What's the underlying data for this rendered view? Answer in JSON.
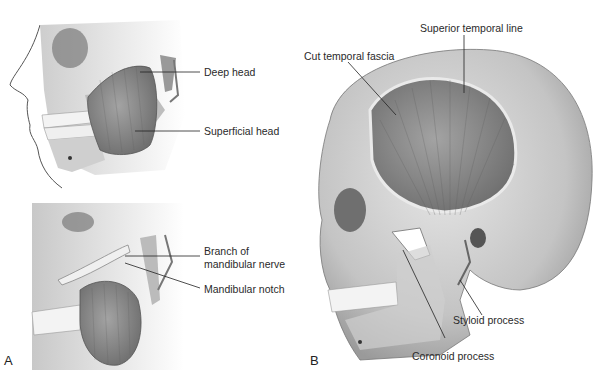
{
  "figure": {
    "panels": [
      {
        "id": "A",
        "letter": "A",
        "subpanels": [
          {
            "name": "top",
            "labels": [
              "Deep head",
              "Superficial head"
            ]
          },
          {
            "name": "bottom",
            "labels": [
              "Branch of",
              "mandibular nerve",
              "Mandibular notch"
            ]
          }
        ]
      },
      {
        "id": "B",
        "letter": "B",
        "labels": [
          "Superior temporal line",
          "Cut temporal fascia",
          "Styloid process",
          "Coronoid process"
        ]
      }
    ]
  },
  "labels": {
    "deep_head": "Deep head",
    "superficial_head": "Superficial head",
    "branch_line1": "Branch of",
    "branch_line2": "mandibular nerve",
    "mandibular_notch": "Mandibular notch",
    "superior_temporal_line": "Superior temporal line",
    "cut_temporal_fascia": "Cut temporal fascia",
    "styloid_process": "Styloid process",
    "coronoid_process": "Coronoid process",
    "panel_a": "A",
    "panel_b": "B"
  },
  "colors": {
    "bone": "#d9d9d9",
    "bone_shadow": "#a8a8a8",
    "muscle": "#8c8c8c",
    "muscle_dark": "#6e6e6e",
    "leader": "#222222"
  }
}
